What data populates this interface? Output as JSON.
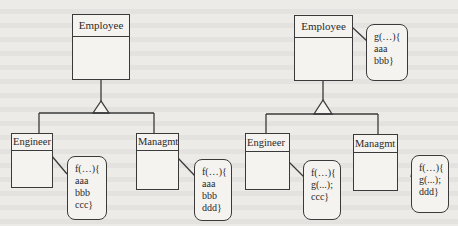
{
  "diagrams": [
    {
      "superclass": {
        "name": "Employee"
      },
      "superclass_note": null,
      "subclasses": [
        {
          "name": "Engineer",
          "note": [
            "f(…){",
            "aaa",
            "bbb",
            "ccc}"
          ]
        },
        {
          "name": "Managmt",
          "note": [
            "f(…){",
            "aaa",
            "bbb",
            "ddd}"
          ]
        }
      ]
    },
    {
      "superclass": {
        "name": "Employee"
      },
      "superclass_note": [
        "g(…){",
        "aaa",
        "bbb}"
      ],
      "subclasses": [
        {
          "name": "Engineer",
          "note": [
            "f(…){",
            "g(...);",
            "ccc}"
          ]
        },
        {
          "name": "Managmt",
          "note": [
            "f(…){",
            "g(...);",
            "ddd}"
          ]
        }
      ]
    }
  ]
}
